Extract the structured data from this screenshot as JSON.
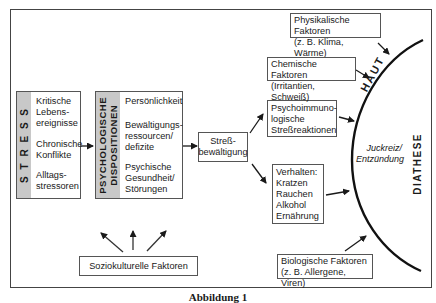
{
  "stress": {
    "band_label": "S T R E S S",
    "items": [
      "Kritische\nLebens-\nereignisse",
      "Chronische\nKonflikte",
      "Alltags-\nstressoren"
    ]
  },
  "dispositions": {
    "band_label": "PSYCHOLOGISCHE\nDISPOSITIONEN",
    "items": [
      "Persönlichkeit",
      "Bewältigungs-\nressourcen/\ndefizite",
      "Psychische\nGesundheit/\nStörungen"
    ]
  },
  "coping": {
    "label": "Streß-\nbewältigung"
  },
  "psychoimmuno": {
    "label": "Psychoimmuno-\nlogische\nStreßreaktionen"
  },
  "behavior": {
    "label": "Verhalten:\nKratzen\nRauchen\nAlkohol\nErnährung"
  },
  "physical": {
    "label": "Physikalische Faktoren\n(z. B. Klima, Wärme)"
  },
  "chemical": {
    "label": "Chemische Faktoren\n(Irritantien, Schweiß)"
  },
  "biological": {
    "label": "Biologische Faktoren\n(z. B. Allergene, Viren)"
  },
  "sociocultural": {
    "label": "Soziokulturelle Faktoren"
  },
  "skin": {
    "label": "HAUT"
  },
  "symptom": {
    "label": "Juckreiz/\nEntzündung"
  },
  "diathesis": {
    "label": "DIATHESE"
  },
  "caption": "Abbildung 1",
  "colors": {
    "band": "#c8c8c8",
    "line": "#1a1a1a",
    "border": "#555555"
  }
}
